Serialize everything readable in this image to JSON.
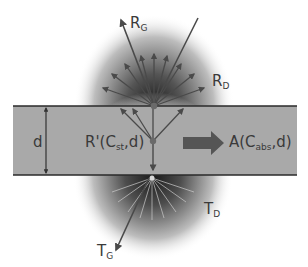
{
  "diagram": {
    "type": "light scattering through a slab",
    "colors": {
      "slab_fill": "#a9a9a9",
      "slab_border": "#2a2a2a",
      "arrow": "#4a4a4a",
      "glow_center": "#1a1a1a",
      "background": "#ffffff",
      "fat_arrow": "#555555"
    },
    "labels": {
      "reflected_specular": {
        "main": "R",
        "sub": "G"
      },
      "reflected_diffuse": {
        "main": "R",
        "sub": "D"
      },
      "transmitted_specular": {
        "main": "T",
        "sub": "G"
      },
      "transmitted_diffuse": {
        "main": "T",
        "sub": "D"
      },
      "thickness": "d",
      "internal_reflectance": {
        "prefix": "R'(C",
        "sub": "st",
        "suffix": ",d)"
      },
      "absorbance": {
        "prefix": "A(C",
        "sub": "abs",
        "suffix": ",d)"
      }
    }
  }
}
